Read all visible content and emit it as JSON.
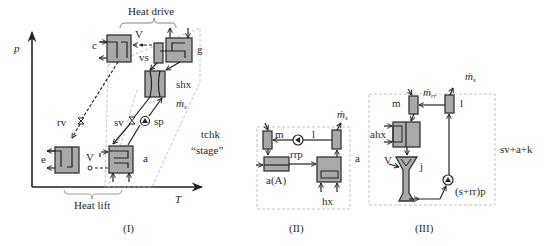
{
  "panels": [
    {
      "id": "I",
      "caption": "(I)"
    },
    {
      "id": "II",
      "caption": "(II)"
    },
    {
      "id": "III",
      "caption": "(III)"
    }
  ],
  "panel1": {
    "axis_y": "p",
    "axis_x": "T",
    "heat_drive": "Heat drive",
    "heat_lift": "Heat lift",
    "c": "c",
    "V_top": "V",
    "vs": "vs",
    "g": "g",
    "shx": "shx",
    "ms": "ṁ",
    "ms_sub": "s",
    "rv": "rv",
    "sv": "sv",
    "sp": "sp",
    "e": "e",
    "V_bot": "V",
    "a": "a",
    "tchk": "tchk",
    "stage": "“stage”"
  },
  "panel2": {
    "m": "m",
    "l": "l",
    "ms": "ṁ",
    "ms_sub": "s",
    "rrp": "rrp",
    "aA": "a(A)",
    "hx": "hx",
    "a": "a"
  },
  "panel3": {
    "ms": "ṁ",
    "ms_sub": "s",
    "mrr": "ṁ",
    "mrr_sub": "rr",
    "m": "m",
    "l": "l",
    "ahx": "ahx",
    "V": "V",
    "j": "j",
    "pump": "(s+rr)p",
    "label": "sv+a+k"
  }
}
